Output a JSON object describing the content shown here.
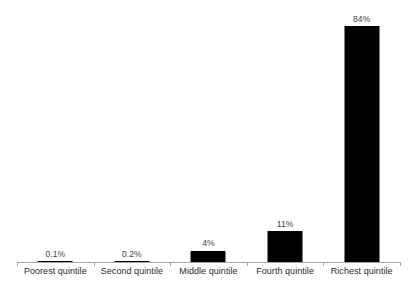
{
  "chart_data": {
    "type": "bar",
    "title": "",
    "subtitle": "",
    "xlabel": "",
    "ylabel": "",
    "categories": [
      "Poorest quintile",
      "Second quintile",
      "Middle quintile",
      "Fourth quintile",
      "Richest quintile"
    ],
    "values": [
      0.1,
      0.2,
      4,
      11,
      84
    ],
    "data_labels": [
      "0.1%",
      "0.2%",
      "4%",
      "11%",
      "84%"
    ],
    "ylim": [
      0,
      90
    ],
    "grid": false,
    "legend": false,
    "legend_position": "none",
    "axis": {
      "x_axis_visible": true,
      "y_axis_visible": false,
      "tick_marks": true
    },
    "series": [
      {
        "name": "",
        "values": [
          0.1,
          0.2,
          4,
          11,
          84
        ]
      }
    ],
    "colors": {
      "bar": "#000000",
      "axis": "#a6a6a6",
      "data_label_text": "#3f3f3f",
      "category_label_text": "#2b2b2b",
      "background": "#ffffff"
    }
  }
}
